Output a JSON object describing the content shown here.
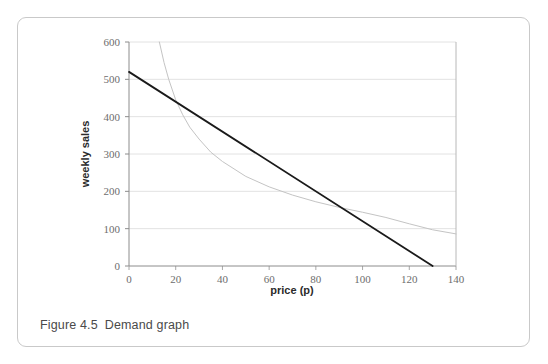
{
  "figure": {
    "caption_number": "Figure 4.5",
    "caption_text": "Demand graph"
  },
  "chart_data": {
    "type": "line",
    "title": "",
    "xlabel": "price (p)",
    "ylabel": "weekly sales",
    "xlim": [
      0,
      140
    ],
    "ylim": [
      0,
      600
    ],
    "xticks": [
      0,
      20,
      40,
      60,
      80,
      100,
      120,
      140
    ],
    "yticks": [
      0,
      100,
      200,
      300,
      400,
      500,
      600
    ],
    "grid": "horizontal",
    "legend": "none",
    "series": [
      {
        "name": "demand line",
        "type": "line",
        "color": "#1a1a1a",
        "width": 1.8,
        "x": [
          0,
          130
        ],
        "y": [
          520,
          0
        ]
      },
      {
        "name": "revenue curve",
        "type": "line",
        "color": "#c4c4c4",
        "width": 1.0,
        "x": [
          13,
          15,
          17,
          20,
          23,
          26,
          30,
          35,
          40,
          50,
          60,
          70,
          80,
          90,
          100,
          110,
          120,
          130,
          140
        ],
        "y": [
          600,
          545,
          500,
          445,
          405,
          372,
          340,
          305,
          280,
          240,
          212,
          190,
          172,
          157,
          144,
          130,
          113,
          97,
          86
        ]
      }
    ]
  },
  "axis": {
    "x_tick_labels": [
      "0",
      "20",
      "40",
      "60",
      "80",
      "100",
      "120",
      "140"
    ],
    "y_tick_labels": [
      "0",
      "100",
      "200",
      "300",
      "400",
      "500",
      "600"
    ]
  }
}
